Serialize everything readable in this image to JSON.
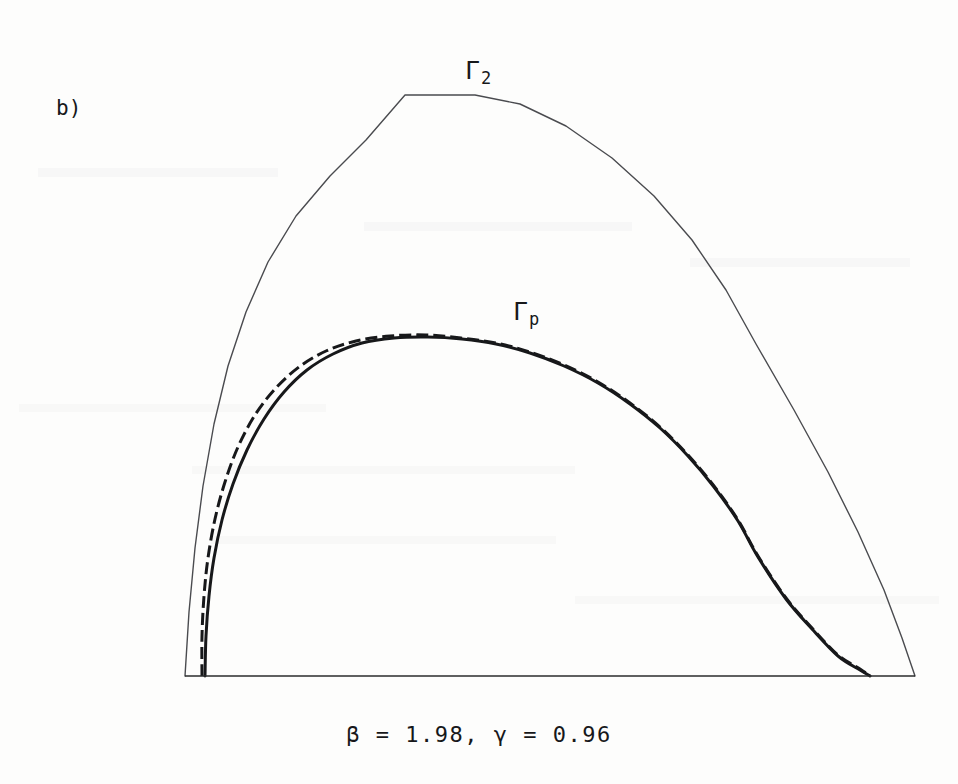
{
  "figure": {
    "panel_label": "b)",
    "caption": "β = 1.98, γ = 0.96",
    "background_color": "#fdfdfc",
    "ink_color": "#17181a"
  },
  "labels": {
    "outer_curve": {
      "symbol": "Γ",
      "subscript": "2",
      "x": 480,
      "y": 75
    },
    "inner_curve": {
      "symbol": "Γ",
      "subscript": "p",
      "x": 530,
      "y": 315
    }
  },
  "chart_data": {
    "type": "line",
    "title": "",
    "subtitle": "",
    "xlabel": "",
    "ylabel": "",
    "grid": false,
    "legend": "inline-annotations",
    "annotations": [
      {
        "text": "b)",
        "x": 56,
        "y": 110
      },
      {
        "text": "Γ2",
        "x": 480,
        "y": 75
      },
      {
        "text": "Γp",
        "x": 530,
        "y": 315
      },
      {
        "text": "β = 1.98, γ = 0.96",
        "x": 479,
        "y": 740
      }
    ],
    "parameters": {
      "beta": 1.98,
      "gamma": 0.96
    },
    "axis_ranges": {
      "xlim": [
        185,
        915
      ],
      "ylim_pixels": [
        95,
        676
      ]
    },
    "baseline": {
      "y": 676,
      "x_start": 185,
      "x_end": 915,
      "stroke": "#2a2b2d",
      "width": 1.6
    },
    "series": [
      {
        "name": "Γ2",
        "style": "solid-thin-polyline",
        "stroke": "#4a4b4f",
        "stroke_width": 1.4,
        "points": [
          [
            185,
            676
          ],
          [
            189,
            612
          ],
          [
            195,
            548
          ],
          [
            203,
            486
          ],
          [
            214,
            424
          ],
          [
            228,
            366
          ],
          [
            246,
            312
          ],
          [
            268,
            262
          ],
          [
            296,
            216
          ],
          [
            330,
            176
          ],
          [
            366,
            140
          ],
          [
            405,
            95
          ],
          [
            475,
            95
          ],
          [
            520,
            104
          ],
          [
            566,
            126
          ],
          [
            612,
            158
          ],
          [
            654,
            196
          ],
          [
            692,
            240
          ],
          [
            726,
            290
          ],
          [
            756,
            344
          ],
          [
            794,
            410
          ],
          [
            828,
            472
          ],
          [
            858,
            532
          ],
          [
            884,
            590
          ],
          [
            902,
            638
          ],
          [
            915,
            676
          ]
        ]
      },
      {
        "name": "Γp-solid",
        "style": "solid-thick-smooth",
        "stroke": "#17181a",
        "stroke_width": 3.0,
        "points": [
          [
            205,
            676
          ],
          [
            206,
            636
          ],
          [
            209,
            596
          ],
          [
            214,
            558
          ],
          [
            222,
            520
          ],
          [
            233,
            484
          ],
          [
            247,
            450
          ],
          [
            264,
            419
          ],
          [
            284,
            392
          ],
          [
            307,
            370
          ],
          [
            333,
            354
          ],
          [
            362,
            343
          ],
          [
            394,
            338
          ],
          [
            428,
            337
          ],
          [
            462,
            339
          ],
          [
            496,
            344
          ],
          [
            530,
            353
          ],
          [
            564,
            366
          ],
          [
            598,
            383
          ],
          [
            630,
            404
          ],
          [
            660,
            428
          ],
          [
            688,
            456
          ],
          [
            714,
            487
          ],
          [
            738,
            521
          ],
          [
            758,
            557
          ],
          [
            786,
            599
          ],
          [
            812,
            629
          ],
          [
            838,
            656
          ],
          [
            860,
            670
          ],
          [
            870,
            676
          ]
        ]
      },
      {
        "name": "Γp-dashed",
        "style": "dashed-thick-smooth",
        "stroke": "#17181a",
        "stroke_width": 3.0,
        "dash": [
          12,
          5
        ],
        "points": [
          [
            202,
            676
          ],
          [
            202,
            636
          ],
          [
            204,
            596
          ],
          [
            208,
            558
          ],
          [
            215,
            519
          ],
          [
            225,
            482
          ],
          [
            238,
            447
          ],
          [
            255,
            415
          ],
          [
            275,
            389
          ],
          [
            299,
            367
          ],
          [
            326,
            351
          ],
          [
            356,
            341
          ],
          [
            390,
            336
          ],
          [
            426,
            335
          ],
          [
            461,
            338
          ],
          [
            496,
            343
          ],
          [
            530,
            352
          ],
          [
            564,
            365
          ],
          [
            598,
            382
          ],
          [
            630,
            403
          ],
          [
            660,
            427
          ],
          [
            688,
            455
          ],
          [
            714,
            486
          ],
          [
            738,
            520
          ],
          [
            758,
            556
          ],
          [
            786,
            598
          ],
          [
            812,
            628
          ],
          [
            838,
            655
          ],
          [
            860,
            669
          ],
          [
            870,
            676
          ]
        ]
      }
    ]
  }
}
